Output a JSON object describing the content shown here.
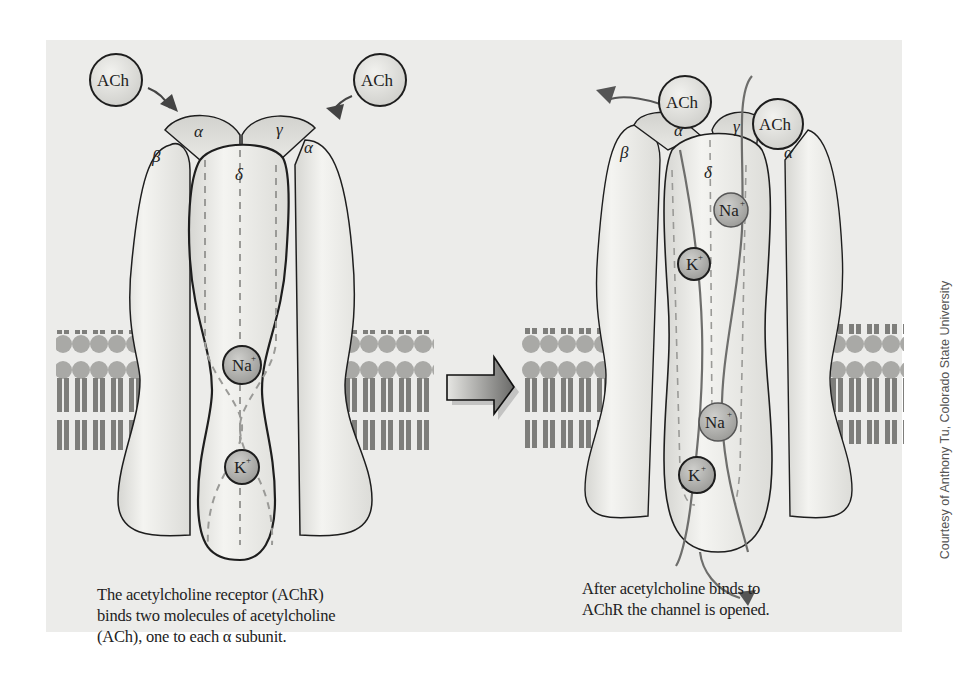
{
  "figure": {
    "left_panel": {
      "state": "closed",
      "subunits": [
        "α",
        "β",
        "δ",
        "γ",
        "α"
      ],
      "ligands": [
        "ACh",
        "ACh"
      ],
      "ions": [
        "Na+",
        "K+"
      ],
      "caption_lines": [
        "The acetylcholine receptor (AChR)",
        "binds two molecules of acetylcholine",
        "(ACh), one to each α subunit."
      ]
    },
    "right_panel": {
      "state": "open",
      "subunits": [
        "α",
        "β",
        "δ",
        "γ",
        "α"
      ],
      "ligands": [
        "ACh",
        "ACh"
      ],
      "ions": [
        "Na+",
        "K+",
        "Na+",
        "K+"
      ],
      "caption_lines": [
        "After acetylcholine binds to",
        "AChR the channel is opened."
      ]
    },
    "transition_arrow": "block-right-arrow",
    "credit": "Courtesy of Anthony Tu, Colorado State University",
    "labels": {
      "ach": "ACh",
      "alpha": "α",
      "beta": "β",
      "gamma": "γ",
      "delta": "δ",
      "na": "Na",
      "k": "K",
      "plus": "+"
    },
    "colors": {
      "panel_bg": "#ececea",
      "protein_fill": "#e6e6e2",
      "protein_stroke": "#1e1e1e",
      "ion_fill": "#a9a9a6",
      "membrane_head": "#a5a5a2",
      "membrane_tail": "#7f7f7c",
      "path_line": "#6e6e6c",
      "dashed": "#9a9a97"
    }
  }
}
